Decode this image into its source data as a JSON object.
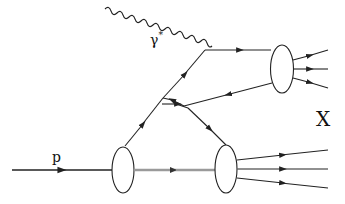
{
  "diagram": {
    "type": "feynman",
    "labels": {
      "photon": "γ",
      "photon_superscript": "*",
      "proton": "p",
      "final_state": "X"
    },
    "colors": {
      "line": "#222222",
      "gluon": "#9a9a9a",
      "background": "#ffffff"
    },
    "nodes": [
      {
        "id": "photon-vertex",
        "x": 205,
        "y": 50
      },
      {
        "id": "proton-blob",
        "x": 123,
        "y": 170
      },
      {
        "id": "upper-hadron-blob",
        "x": 282,
        "y": 69
      },
      {
        "id": "lower-hadron-blob",
        "x": 226,
        "y": 169
      }
    ],
    "edges": [
      {
        "from": "incoming-photon",
        "to": "photon-vertex",
        "kind": "wavy"
      },
      {
        "from": "incoming-proton",
        "to": "proton-blob",
        "kind": "fermion"
      },
      {
        "from": "proton-blob",
        "to": "lower-hadron-blob",
        "kind": "remnant"
      },
      {
        "from": "photon-vertex",
        "to": "upper-hadron-blob",
        "kind": "fermion"
      },
      {
        "from": "upper-hadron-blob",
        "to": "crossing",
        "kind": "fermion"
      },
      {
        "from": "proton-blob",
        "to": "photon-vertex",
        "kind": "fermion"
      },
      {
        "from": "crossing",
        "to": "lower-hadron-blob",
        "kind": "fermion"
      }
    ]
  }
}
